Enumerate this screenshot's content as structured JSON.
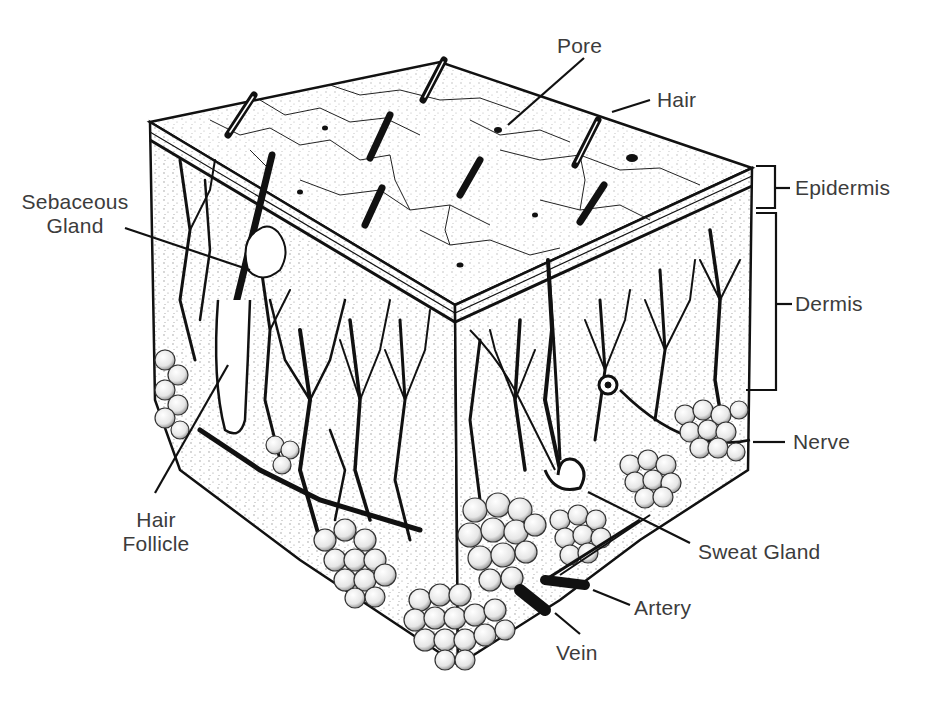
{
  "diagram": {
    "labels": {
      "pore": "Pore",
      "hair": "Hair",
      "epidermis": "Epidermis",
      "dermis": "Dermis",
      "nerve": "Nerve",
      "sweat_gland": "Sweat Gland",
      "artery": "Artery",
      "vein": "Vein",
      "sebaceous_gland_line1": "Sebaceous",
      "sebaceous_gland_line2": "Gland",
      "hair_follicle_line1": "Hair",
      "hair_follicle_line2": "Follicle"
    },
    "colors": {
      "ink": "#111111",
      "label_text": "#3c3c3c",
      "background": "#ffffff",
      "fat_lobule": "#f4f4f4"
    }
  }
}
